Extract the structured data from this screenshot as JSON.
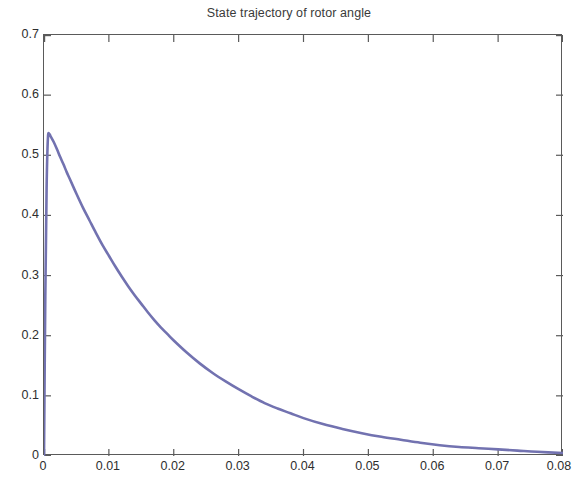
{
  "chart_data": {
    "type": "line",
    "title": "State trajectory of rotor angle",
    "xlabel": "",
    "ylabel": "",
    "xlim": [
      0,
      0.08
    ],
    "ylim": [
      0,
      0.7
    ],
    "xticks": [
      "0",
      "0.01",
      "0.02",
      "0.03",
      "0.04",
      "0.05",
      "0.06",
      "0.07",
      "0.08"
    ],
    "xtick_values": [
      0,
      0.01,
      0.02,
      0.03,
      0.04,
      0.05,
      0.06,
      0.07,
      0.08
    ],
    "yticks": [
      "0",
      "0.1",
      "0.2",
      "0.3",
      "0.4",
      "0.5",
      "0.6",
      "0.7"
    ],
    "ytick_values": [
      0,
      0.1,
      0.2,
      0.3,
      0.4,
      0.5,
      0.6,
      0.7
    ],
    "grid": false,
    "legend": null,
    "line_color": "#7272b0",
    "line_width": 2.6,
    "series": [
      {
        "name": "rotor angle",
        "x": [
          0,
          0.0002,
          0.0004,
          0.0006,
          0.0008,
          0.001,
          0.0015,
          0.002,
          0.0025,
          0.003,
          0.0035,
          0.004,
          0.005,
          0.006,
          0.007,
          0.008,
          0.009,
          0.01,
          0.011,
          0.012,
          0.013,
          0.014,
          0.015,
          0.016,
          0.017,
          0.018,
          0.019,
          0.02,
          0.022,
          0.024,
          0.026,
          0.028,
          0.03,
          0.032,
          0.034,
          0.036,
          0.038,
          0.04,
          0.043,
          0.046,
          0.049,
          0.052,
          0.055,
          0.058,
          0.061,
          0.064,
          0.067,
          0.07,
          0.073,
          0.076,
          0.08
        ],
        "y": [
          0.0,
          0.265,
          0.445,
          0.528,
          0.535,
          0.532,
          0.522,
          0.51,
          0.497,
          0.485,
          0.472,
          0.46,
          0.436,
          0.413,
          0.392,
          0.371,
          0.351,
          0.333,
          0.315,
          0.298,
          0.282,
          0.267,
          0.253,
          0.239,
          0.226,
          0.214,
          0.203,
          0.192,
          0.172,
          0.154,
          0.138,
          0.124,
          0.111,
          0.099,
          0.088,
          0.079,
          0.071,
          0.063,
          0.053,
          0.045,
          0.038,
          0.032,
          0.027,
          0.022,
          0.018,
          0.015,
          0.013,
          0.011,
          0.009,
          0.007,
          0.005
        ]
      }
    ],
    "peak": {
      "x": 0.0008,
      "y": 0.535
    }
  },
  "figure": {
    "background": "#ffffff",
    "axis_color": "#5a5a5a",
    "text_color": "#2e2e2e"
  }
}
